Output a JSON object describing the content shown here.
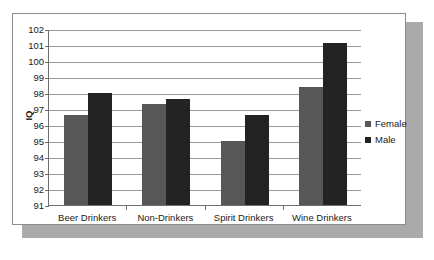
{
  "chart_data": {
    "type": "bar",
    "title": "",
    "subtitle": "",
    "xlabel": "",
    "ylabel": "IQ",
    "categories": [
      "Beer Drinkers",
      "Non-Drinkers",
      "Spirit Drinkers",
      "Wine Drinkers"
    ],
    "series": [
      {
        "name": "Female",
        "color": "#575757",
        "values": [
          96.6,
          97.3,
          95.0,
          98.4
        ]
      },
      {
        "name": "Male",
        "color": "#232323",
        "values": [
          98.0,
          97.6,
          96.6,
          101.1
        ]
      }
    ],
    "ylim": [
      91,
      102
    ],
    "ytick_labels": [
      "102",
      "101",
      "100",
      "99",
      "98",
      "97",
      "96",
      "95",
      "94",
      "93",
      "92",
      "91"
    ],
    "ytick_values": [
      102,
      101,
      100,
      99,
      98,
      97,
      96,
      95,
      94,
      93,
      92,
      91
    ],
    "grid": true,
    "grid_axis": "y",
    "legend_position": "right",
    "legend": [
      "Female",
      "Male"
    ]
  },
  "colors": {
    "female_bar": "#575757",
    "male_bar": "#232323",
    "gridline": "#9a9a9a",
    "axis": "#6e6e6e",
    "frame_border": "#8c8c8c",
    "shadow": "#aaaaaa",
    "plot_background": "#ffffff",
    "text": "#1a1a1a"
  }
}
